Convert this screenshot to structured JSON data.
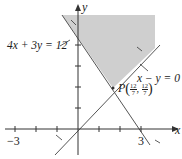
{
  "diagram": {
    "axes": {
      "x_label": "x",
      "y_label": "y",
      "tick_labels": {
        "x_neg": "−3",
        "x_pos": "3"
      }
    },
    "lines": [
      {
        "equation": "4x + 3y = 12",
        "label": "4x + 3y = 12"
      },
      {
        "equation": "x − y = 0",
        "label": "x − y = 0"
      }
    ],
    "point": {
      "name": "P",
      "coords": "(12/7, 12/7)",
      "x_num": "12",
      "x_den": "7",
      "y_num": "12",
      "y_den": "7"
    },
    "colors": {
      "shade": "#cfcfcf",
      "line": "#555555",
      "axis": "#333333"
    }
  }
}
